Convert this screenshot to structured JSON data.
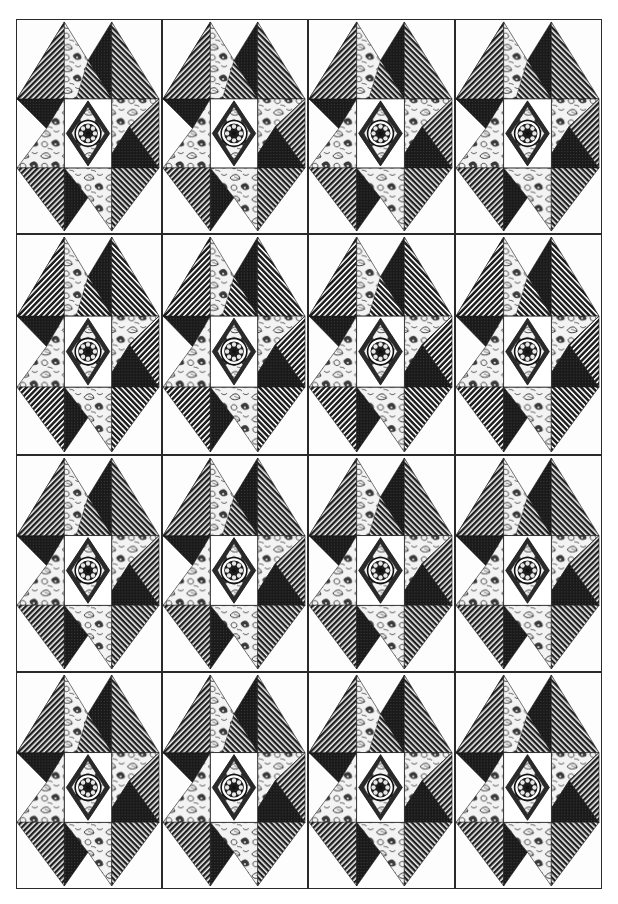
{
  "illustration": {
    "title": "Quilt block layout",
    "grid": {
      "rows": 4,
      "cols": 4
    },
    "col_edges": [
      16,
      162,
      308,
      455,
      602
    ],
    "row_edges": [
      19,
      234,
      455,
      672,
      889
    ],
    "colors": {
      "background": "#ffffff",
      "outline": "#2a2a2a",
      "dark_fabric": "#1c1c1c",
      "stripe_fabric": "#2e2e2e",
      "floral_fabric": "#f2f2f2",
      "center_square": "#ffffff"
    },
    "block": {
      "pieces": [
        "top-left-diamond-striped",
        "top-right-diamond-dark",
        "floral-triangle-top",
        "floral-triangle-left",
        "floral-triangle-right",
        "floral-triangle-bottom",
        "bottom-left-diamond-striped",
        "bottom-right-diamond-dark",
        "center-square",
        "center-medallion"
      ]
    },
    "blocks": [
      {
        "label": "block-r1-c1"
      },
      {
        "label": "block-r1-c2"
      },
      {
        "label": "block-r1-c3"
      },
      {
        "label": "block-r1-c4"
      },
      {
        "label": "block-r2-c1"
      },
      {
        "label": "block-r2-c2"
      },
      {
        "label": "block-r2-c3"
      },
      {
        "label": "block-r2-c4"
      },
      {
        "label": "block-r3-c1"
      },
      {
        "label": "block-r3-c2"
      },
      {
        "label": "block-r3-c3"
      },
      {
        "label": "block-r3-c4"
      },
      {
        "label": "block-r4-c1"
      },
      {
        "label": "block-r4-c2"
      },
      {
        "label": "block-r4-c3"
      },
      {
        "label": "block-r4-c4"
      }
    ]
  }
}
